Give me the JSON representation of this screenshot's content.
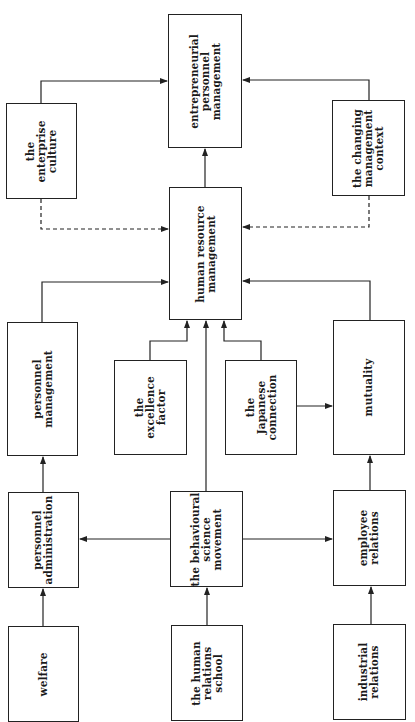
{
  "diagram": {
    "orientation": "rotated-90-ccw",
    "nodes": [
      {
        "id": "entrepreneurial",
        "label": "entrepreneurial\npersonnel\nmanagement",
        "x": 168,
        "y": 14,
        "w": 74,
        "h": 134
      },
      {
        "id": "enterprise",
        "label": "the\nenterprise\nculture",
        "x": 6,
        "y": 103,
        "w": 71,
        "h": 96
      },
      {
        "id": "changing",
        "label": "the changing\nmanagement\ncontext",
        "x": 332,
        "y": 100,
        "w": 73,
        "h": 96
      },
      {
        "id": "hrm",
        "label": "human resource\nmanagement",
        "x": 169,
        "y": 187,
        "w": 73,
        "h": 133
      },
      {
        "id": "personnel_mgmt",
        "label": "personnel\nmanagement",
        "x": 7,
        "y": 322,
        "w": 71,
        "h": 134
      },
      {
        "id": "excellence",
        "label": "the\nexcellence\nfactor",
        "x": 114,
        "y": 360,
        "w": 73,
        "h": 95
      },
      {
        "id": "japanese",
        "label": "the\nJapanese\nconnection",
        "x": 225,
        "y": 360,
        "w": 72,
        "h": 95
      },
      {
        "id": "mutuality",
        "label": "mutuality",
        "x": 333,
        "y": 320,
        "w": 72,
        "h": 135
      },
      {
        "id": "personnel_admin",
        "label": "personnel\nadministration",
        "x": 8,
        "y": 492,
        "w": 71,
        "h": 96
      },
      {
        "id": "behavioural",
        "label": "the behavioural\nscience\nmovement",
        "x": 170,
        "y": 491,
        "w": 73,
        "h": 96
      },
      {
        "id": "employee",
        "label": "employee\nrelations",
        "x": 333,
        "y": 490,
        "w": 73,
        "h": 96
      },
      {
        "id": "welfare",
        "label": "welfare",
        "x": 8,
        "y": 626,
        "w": 71,
        "h": 96
      },
      {
        "id": "human_relations",
        "label": "the human\nrelations\nschool",
        "x": 171,
        "y": 625,
        "w": 72,
        "h": 96
      },
      {
        "id": "industrial",
        "label": "industrial\nrelations",
        "x": 333,
        "y": 624,
        "w": 73,
        "h": 96
      }
    ],
    "edges": [
      {
        "from": "enterprise",
        "to": "entrepreneurial",
        "style": "solid"
      },
      {
        "from": "changing",
        "to": "entrepreneurial",
        "style": "solid"
      },
      {
        "from": "hrm",
        "to": "entrepreneurial",
        "style": "solid"
      },
      {
        "from": "enterprise",
        "to": "hrm",
        "style": "dashed"
      },
      {
        "from": "changing",
        "to": "hrm",
        "style": "dashed"
      },
      {
        "from": "personnel_mgmt",
        "to": "hrm",
        "style": "solid"
      },
      {
        "from": "mutuality",
        "to": "hrm",
        "style": "solid"
      },
      {
        "from": "excellence",
        "to": "hrm",
        "style": "solid"
      },
      {
        "from": "behavioural",
        "to": "hrm",
        "style": "solid"
      },
      {
        "from": "japanese",
        "to": "hrm",
        "style": "solid"
      },
      {
        "from": "japanese",
        "to": "mutuality",
        "style": "solid"
      },
      {
        "from": "personnel_admin",
        "to": "personnel_mgmt",
        "style": "solid"
      },
      {
        "from": "employee",
        "to": "mutuality",
        "style": "solid"
      },
      {
        "from": "behavioural",
        "to": "personnel_admin",
        "style": "solid"
      },
      {
        "from": "behavioural",
        "to": "employee",
        "style": "solid"
      },
      {
        "from": "welfare",
        "to": "personnel_admin",
        "style": "solid"
      },
      {
        "from": "human_relations",
        "to": "behavioural",
        "style": "solid"
      },
      {
        "from": "industrial",
        "to": "employee",
        "style": "solid"
      }
    ]
  }
}
